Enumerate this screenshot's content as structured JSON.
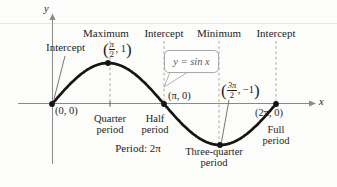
{
  "chart_data": {
    "type": "line",
    "title": "y = sin x",
    "function": "sin",
    "xlabel": "x",
    "ylabel": "y",
    "amplitude": 1,
    "period": "2π",
    "x_tick_labels": [
      "0",
      "π/2",
      "π",
      "3π/2",
      "2π"
    ],
    "ylim": [
      -1,
      1
    ],
    "key_points": [
      {
        "x": "0",
        "y": 0,
        "label": "(0, 0)",
        "feature": "Intercept"
      },
      {
        "x": "π/2",
        "y": 1,
        "label": "(π/2, 1)",
        "feature": "Maximum"
      },
      {
        "x": "π",
        "y": 0,
        "label": "(π, 0)",
        "feature": "Intercept"
      },
      {
        "x": "3π/2",
        "y": -1,
        "label": "(3π/2, −1)",
        "feature": "Minimum"
      },
      {
        "x": "2π",
        "y": 0,
        "label": "(2π, 0)",
        "feature": "Intercept"
      }
    ]
  },
  "axes": {
    "x": "x",
    "y": "y"
  },
  "annotations": {
    "maximum": "Maximum",
    "intercept_mid": "Intercept",
    "minimum": "Minimum",
    "intercept_right": "Intercept",
    "intercept_origin": "Intercept",
    "equation_callout": "y = sin x"
  },
  "points": {
    "origin": "(0, 0)",
    "pi": "(π, 0)",
    "two_pi": "(2π, 0)",
    "max": {
      "open": "(",
      "num": "π",
      "den": "2",
      "rest": ", 1",
      "close": ")"
    },
    "min": {
      "open": "(",
      "num": "3π",
      "den": "2",
      "rest": ", −1",
      "close": ")"
    }
  },
  "periods": {
    "quarter_1": "Quarter",
    "quarter_2": "period",
    "half_1": "Half",
    "half_2": "period",
    "three_quarter_1": "Three-quarter",
    "three_quarter_2": "period",
    "full_1": "Full",
    "full_2": "period",
    "total": "Period: 2π"
  },
  "colors": {
    "curve": "#151515",
    "axis": "#8a8a8a",
    "dashed": "#9a9a9a",
    "paper": "#fcfcfa"
  }
}
